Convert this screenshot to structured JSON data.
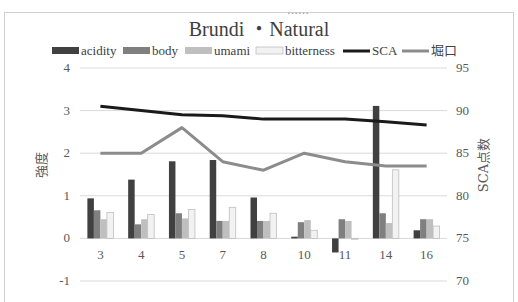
{
  "header": {
    "clipped_text": "……"
  },
  "chart_data": {
    "type": "bar",
    "title": "Brundi ・Natural",
    "xlabel": "",
    "ylabel": "強度",
    "y2label": "SCA点数",
    "categories": [
      "3",
      "4",
      "5",
      "7",
      "8",
      "10",
      "11",
      "14",
      "16"
    ],
    "ylim": [
      -1,
      4
    ],
    "yticks": [
      4,
      3,
      2,
      1,
      0,
      -1
    ],
    "y2lim": [
      70,
      95
    ],
    "y2ticks": [
      95,
      90,
      85,
      80,
      75,
      70
    ],
    "grid": true,
    "legend_position": "top",
    "series": [
      {
        "name": "acidity",
        "type": "bar",
        "axis": "left",
        "color": "#404040",
        "values": [
          0.94,
          1.38,
          1.81,
          1.84,
          0.96,
          0.04,
          -0.33,
          3.11,
          0.19
        ]
      },
      {
        "name": "body",
        "type": "bar",
        "axis": "left",
        "color": "#7f7f7f",
        "values": [
          0.66,
          0.33,
          0.59,
          0.41,
          0.41,
          0.38,
          0.45,
          0.59,
          0.45
        ]
      },
      {
        "name": "umami",
        "type": "bar",
        "axis": "left",
        "color": "#bfbfbf",
        "values": [
          0.45,
          0.45,
          0.47,
          0.41,
          0.41,
          0.43,
          0.41,
          0.36,
          0.45
        ]
      },
      {
        "name": "bitterness",
        "type": "bar",
        "axis": "left",
        "color": "#f2f2f2",
        "values": [
          0.61,
          0.56,
          0.68,
          0.73,
          0.59,
          0.19,
          -0.02,
          1.61,
          0.29
        ]
      },
      {
        "name": "SCA",
        "type": "line",
        "axis": "right",
        "color": "#1a1a1a",
        "values": [
          90.5,
          90.0,
          89.5,
          89.4,
          89.0,
          89.0,
          89.0,
          88.7,
          88.3
        ]
      },
      {
        "name": "堀口",
        "type": "line",
        "axis": "right",
        "color": "#8c8c8c",
        "values": [
          85.0,
          85.0,
          88.0,
          84.0,
          83.0,
          85.0,
          84.0,
          83.5,
          83.5
        ]
      }
    ]
  }
}
